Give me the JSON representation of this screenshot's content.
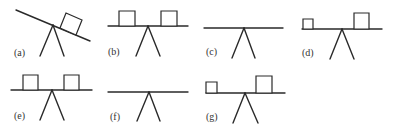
{
  "figure": {
    "colors": {
      "stroke": "#2a2a2a",
      "label": "#333333",
      "background": "#ffffff"
    },
    "panels": [
      {
        "id": "a",
        "label": "(a)",
        "label_pos": [
          14,
          56
        ],
        "beam": [
          16,
          10,
          90,
          41
        ],
        "legs": [
          [
            53,
            25,
            40,
            56
          ],
          [
            53,
            25,
            64,
            56
          ]
        ],
        "boxes": [
          {
            "points": "66,13 82,20 76,35 60,28"
          }
        ]
      },
      {
        "id": "b",
        "label": "(b)",
        "label_pos": [
          108,
          55
        ],
        "beam": [
          108,
          26,
          188,
          26
        ],
        "legs": [
          [
            148,
            26,
            136,
            56
          ],
          [
            148,
            26,
            160,
            56
          ]
        ],
        "boxes": [
          {
            "points": "119,11 135,11 135,26 119,26"
          },
          {
            "points": "161,11 177,11 177,26 161,26"
          }
        ]
      },
      {
        "id": "c",
        "label": "(c)",
        "label_pos": [
          206,
          55
        ],
        "beam": [
          204,
          28,
          283,
          28
        ],
        "legs": [
          [
            244,
            28,
            232,
            58
          ],
          [
            244,
            28,
            255,
            58
          ]
        ],
        "boxes": []
      },
      {
        "id": "d",
        "label": "(d)",
        "label_pos": [
          302,
          56
        ],
        "beam": [
          302,
          29,
          382,
          29
        ],
        "legs": [
          [
            342,
            29,
            330,
            59
          ],
          [
            342,
            29,
            354,
            59
          ]
        ],
        "boxes": [
          {
            "points": "303,19 313,19 313,29 303,29"
          },
          {
            "points": "354,13 369,13 369,29 354,29"
          }
        ]
      },
      {
        "id": "e",
        "label": "(e)",
        "label_pos": [
          14,
          119
        ],
        "beam": [
          11,
          90,
          92,
          90
        ],
        "legs": [
          [
            52,
            90,
            40,
            120
          ],
          [
            52,
            90,
            64,
            120
          ]
        ],
        "boxes": [
          {
            "points": "23,75 38,75 38,90 23,90"
          },
          {
            "points": "64,75 79,75 79,90 64,90"
          }
        ]
      },
      {
        "id": "f",
        "label": "(f)",
        "label_pos": [
          110,
          120
        ],
        "beam": [
          108,
          92,
          188,
          92
        ],
        "legs": [
          [
            149,
            92,
            137,
            121
          ],
          [
            149,
            92,
            160,
            121
          ]
        ],
        "boxes": []
      },
      {
        "id": "g",
        "label": "(g)",
        "label_pos": [
          206,
          120
        ],
        "beam": [
          206,
          93,
          285,
          93
        ],
        "legs": [
          [
            245,
            93,
            233,
            123
          ],
          [
            245,
            93,
            258,
            123
          ]
        ],
        "boxes": [
          {
            "points": "206,82 217,82 217,93 206,93"
          },
          {
            "points": "256,76 272,76 272,93 256,93"
          }
        ]
      }
    ]
  }
}
